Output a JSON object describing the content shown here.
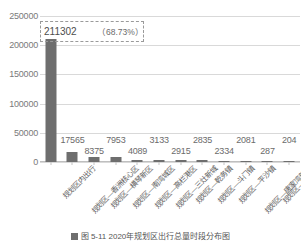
{
  "chart_data": {
    "type": "bar",
    "title": "",
    "xlabel": "",
    "ylabel": "",
    "ylim": [
      0,
      250000
    ],
    "grid": true,
    "legend_position": "bottom",
    "bar_color": "#6e6e6e",
    "categories": [
      "规划区内出行",
      "规划区—香洲核心区",
      "规划区—横琴新区",
      "规划区—南湾城区",
      "规划区—高栏港区",
      "规划区—三灶新城",
      "规划区—乾务镇",
      "规划区—斗门镇",
      "规划区—平沙镇",
      "规划区—唐家湾新城",
      "规划区—莲洲镇",
      "规划区—白蕉镇"
    ],
    "values": [
      211302,
      17565,
      8375,
      7953,
      4089,
      3133,
      2915,
      2835,
      2334,
      2081,
      287,
      204
    ],
    "value_labels": [
      "211302",
      "17565",
      "8375",
      "7953",
      "4089",
      "3133",
      "2915",
      "2835",
      "2334",
      "2081",
      "287",
      "204"
    ],
    "ytick_labels": [
      "0",
      "50000",
      "100000",
      "150000",
      "200000",
      "250000"
    ],
    "ytick_values": [
      0,
      50000,
      100000,
      150000,
      200000,
      250000
    ],
    "annotations": [
      {
        "name": "highlight-callout",
        "value_text": "211302",
        "percent_text": "（68.73%）",
        "target_category": "规划区内出行"
      }
    ]
  },
  "callout": {
    "value": "211302",
    "percent": "（68.73%）"
  },
  "caption": {
    "text": "图 5-11  2020年规划区出行总量时段分布图",
    "legend_label": "出行量"
  }
}
